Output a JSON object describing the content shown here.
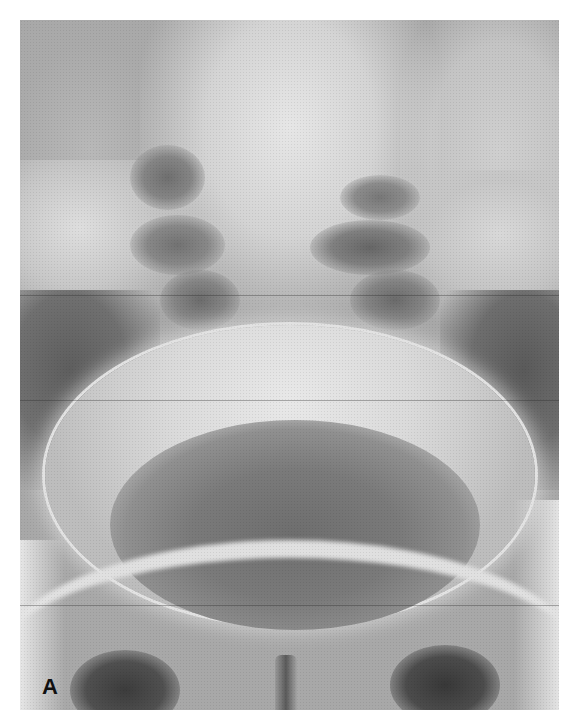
{
  "figure": {
    "panel_label": "A",
    "colors": {
      "background": "#ffffff",
      "bone_bright": "#e0e0e0",
      "soft_tissue": "#a8a8a8",
      "gas_dark": "#5a5a5a"
    }
  }
}
